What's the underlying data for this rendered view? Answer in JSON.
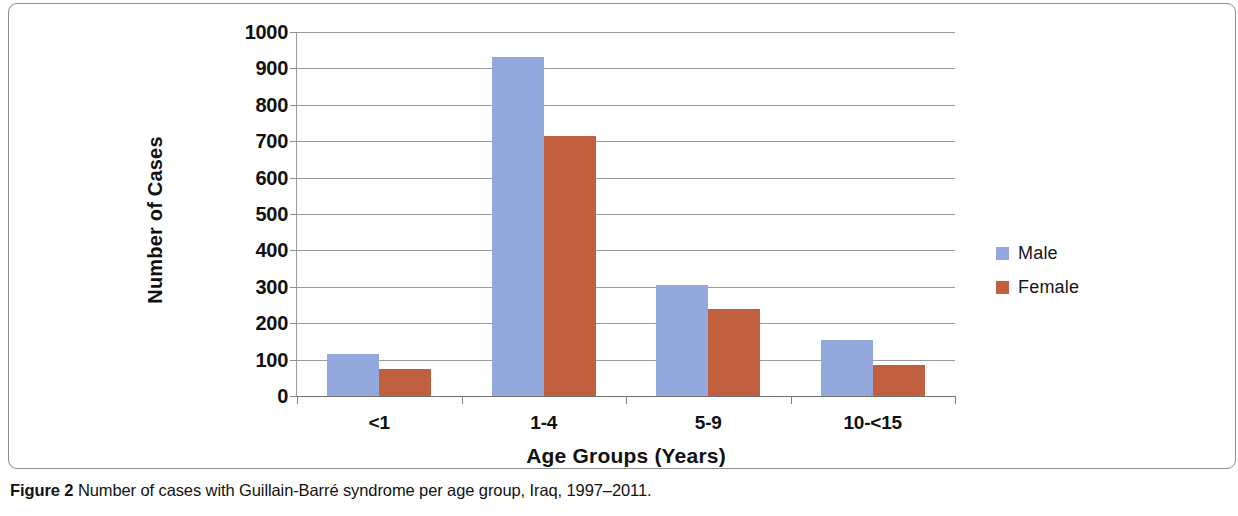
{
  "chart_data": {
    "type": "bar",
    "title": "",
    "xlabel": "Age Groups (Years)",
    "ylabel": "Number of Cases",
    "categories": [
      "<1",
      "1-4",
      "5-9",
      "10-<15"
    ],
    "series": [
      {
        "name": "Male",
        "color": "#93a9dd",
        "values": [
          115,
          930,
          305,
          155
        ]
      },
      {
        "name": "Female",
        "color": "#c0603f",
        "values": [
          75,
          715,
          240,
          85
        ]
      }
    ],
    "ylim": [
      0,
      1000
    ],
    "ytick_step": 100,
    "yticks": [
      1000,
      900,
      800,
      700,
      600,
      500,
      400,
      300,
      200,
      100,
      0
    ],
    "ytick_labels": [
      "1000",
      "900",
      "800",
      "700",
      "600",
      "500",
      "400",
      "300",
      "200",
      "100",
      "0"
    ],
    "grid": true,
    "grid_axis": "y",
    "legend_position": "right",
    "legend_entries": [
      "Male",
      "Female"
    ]
  },
  "caption": {
    "label": "Figure 2",
    "text": "Number of cases with Guillain-Barré syndrome per age group, Iraq, 1997–2011."
  }
}
